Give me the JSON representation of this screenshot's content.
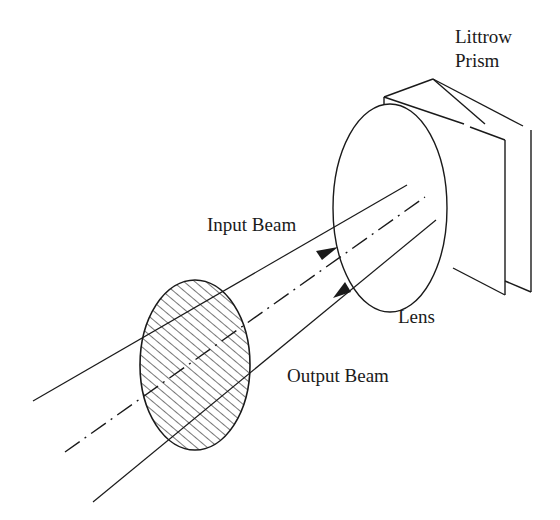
{
  "diagram": {
    "labels": {
      "prism_line1": "Littrow",
      "prism_line2": "Prism",
      "input_beam": "Input Beam",
      "lens": "Lens",
      "output_beam": "Output Beam"
    },
    "components": [
      {
        "name": "hatched-aperture",
        "type": "ellipse",
        "cx": 195,
        "cy": 365,
        "rx": 55,
        "ry": 85,
        "fill": "hatched"
      },
      {
        "name": "lens",
        "type": "ellipse",
        "cx": 390,
        "cy": 208,
        "rx": 57,
        "ry": 104
      },
      {
        "name": "littrow-prism",
        "type": "prism"
      }
    ],
    "beams": [
      {
        "name": "input-beam",
        "direction": "toward-lens",
        "arrow_at": [
          330,
          250
        ]
      },
      {
        "name": "optical-axis",
        "style": "dash-dot"
      },
      {
        "name": "output-beam",
        "direction": "away-from-lens",
        "arrow_at": [
          340,
          295
        ]
      }
    ],
    "colors": {
      "line": "#1a1a1a",
      "background": "#ffffff"
    }
  }
}
